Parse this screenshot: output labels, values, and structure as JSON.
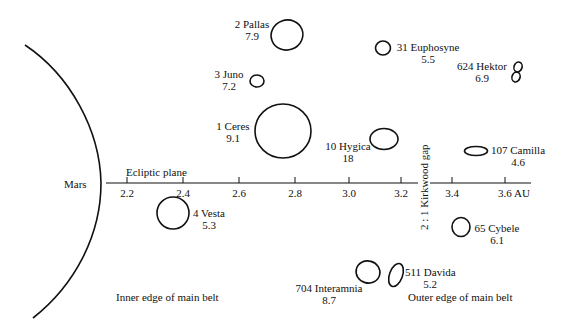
{
  "planet": {
    "label": "Mars"
  },
  "axis": {
    "label": "Ecliptic plane",
    "unit": "AU",
    "ticks": [
      "2.2",
      "2.4",
      "2.6",
      "2.8",
      "3.0",
      "3.2",
      "3.4",
      "3.6 AU"
    ]
  },
  "gap": {
    "label": "2 : 1 Kirkwood gap"
  },
  "belt": {
    "inner_edge": "Inner edge of main belt",
    "outer_edge": "Outer edge of main belt"
  },
  "asteroids": [
    {
      "name": "2 Pallas",
      "value": "7.9"
    },
    {
      "name": "3 Juno",
      "value": "7.2"
    },
    {
      "name": "1 Ceres",
      "value": "9.1"
    },
    {
      "name": "4 Vesta",
      "value": "5.3"
    },
    {
      "name": "10 Hygica",
      "value": "18"
    },
    {
      "name": "31 Euphosyne",
      "value": "5.5"
    },
    {
      "name": "624 Hektor",
      "value": "6.9"
    },
    {
      "name": "107 Camilla",
      "value": "4.6"
    },
    {
      "name": "65 Cybele",
      "value": "6.1"
    },
    {
      "name": "704 Interamnia",
      "value": "8.7"
    },
    {
      "name": "511 Davida",
      "value": "5.2"
    }
  ],
  "colors": {
    "line": "#111111",
    "background": "#ffffff"
  }
}
